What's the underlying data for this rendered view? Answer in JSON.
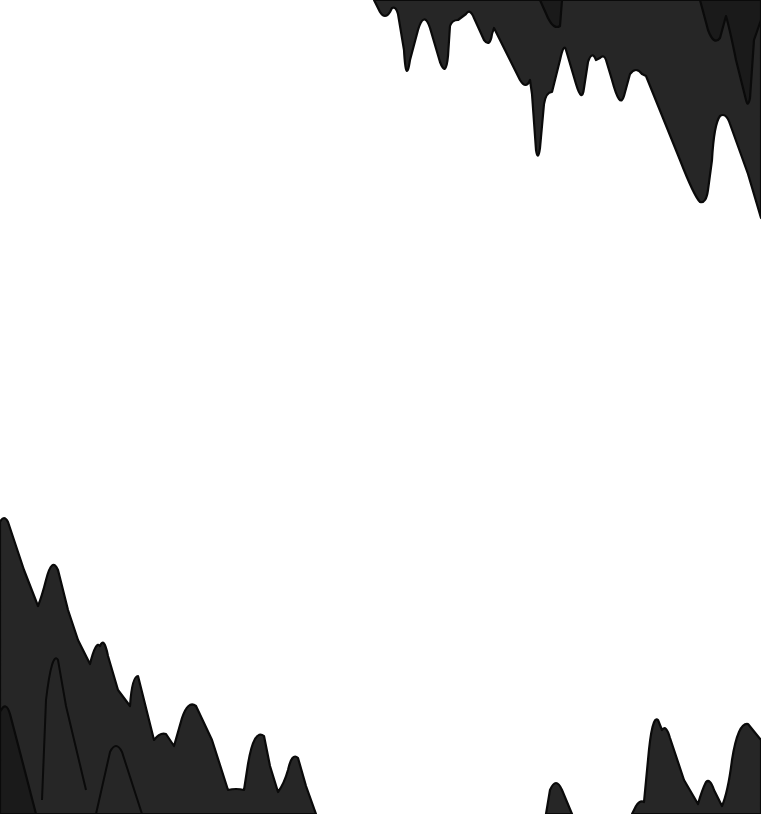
{
  "scene": {
    "type": "cave-background",
    "background_color": "#ffffff",
    "rock_fill_color": "#262626",
    "rock_shadow_color": "#1a1a1a",
    "rock_outline_color": "#0a0a0a",
    "elements": [
      {
        "name": "stalactites-top-right",
        "kind": "ceiling-rock"
      },
      {
        "name": "stalagmites-bottom-left",
        "kind": "floor-rock"
      },
      {
        "name": "stalagmites-bottom-right",
        "kind": "floor-rock"
      }
    ]
  }
}
